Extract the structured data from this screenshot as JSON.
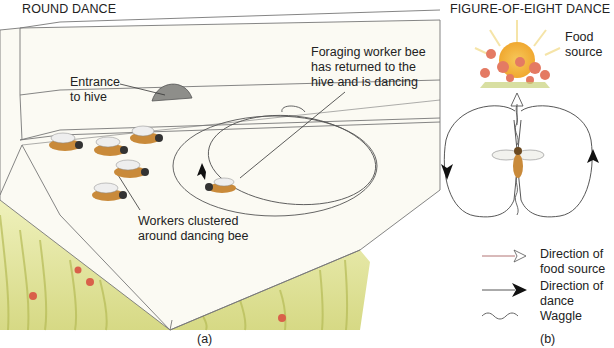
{
  "panel_a": {
    "title": "ROUND DANCE",
    "labels": {
      "entrance": "Entrance\nto hive",
      "forager": "Foraging worker bee\nhas returned to the\nhive and is dancing",
      "workers": "Workers clustered\naround dancing bee"
    },
    "caption": "(a)"
  },
  "panel_b": {
    "title": "FIGURE-OF-EIGHT DANCE",
    "food_source": "Food\nsource",
    "legend": [
      {
        "icon": "open-arrow-icon",
        "label": "Direction of\nfood source"
      },
      {
        "icon": "filled-arrow-icon",
        "label": "Direction of\ndance"
      },
      {
        "icon": "waggle-line-icon",
        "label": "Waggle"
      }
    ],
    "caption": "(b)"
  },
  "colors": {
    "grass": "#d9d98a",
    "grass_dark": "#b9bf5a",
    "hive": "#f7f6ee",
    "flower": "#d9604a",
    "sun": "#f2b13c",
    "bee_body": "#c98a3a",
    "line": "#555555"
  }
}
